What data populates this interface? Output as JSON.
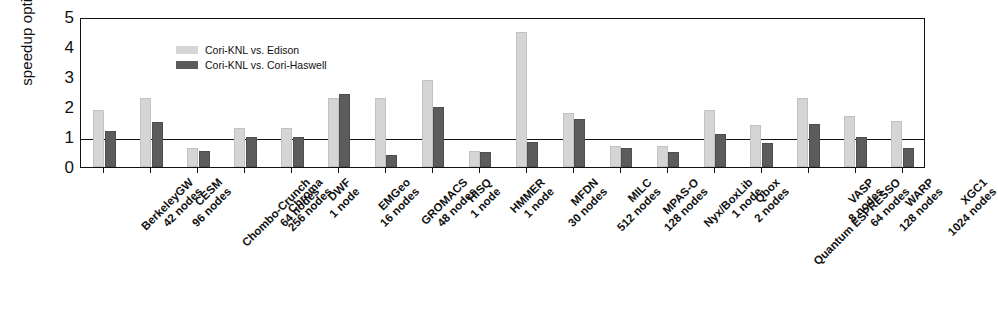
{
  "chart_data": {
    "type": "bar",
    "title": "",
    "xlabel": "",
    "ylabel": "speedup optimized",
    "ylim": [
      0,
      5
    ],
    "yticks": [
      0,
      1,
      2,
      3,
      4,
      5
    ],
    "grid": false,
    "reference_line": 1,
    "legend_position": "top-left",
    "categories": [
      "BerkeleyGW 42 nodes",
      "CESM 96 nodes",
      "Chombo-Crunch 64 nodes",
      "Chroma 256 nodes",
      "DWF 1 node",
      "EMGeo 16 nodes",
      "GROMACS 48 nodes",
      "HISQ 1 node",
      "HMMER 1 node",
      "MFDN 30 nodes",
      "MILC 512 nodes",
      "MPAS-O 128 nodes",
      "Nyx/BoxLib 1 node",
      "Qbox 2 nodes",
      "Quantum ESPRESSO 64 nodes",
      "VASP 8 nodes",
      "WARP 128 nodes",
      "XGC1 1024 nodes"
    ],
    "category_lines": [
      [
        "BerkeleyGW",
        "42 nodes"
      ],
      [
        "CESM",
        "96 nodes"
      ],
      [
        "Chombo-Crunch",
        "64 nodes"
      ],
      [
        "Chroma",
        "256 nodes"
      ],
      [
        "DWF",
        "1 node"
      ],
      [
        "EMGeo",
        "16 nodes"
      ],
      [
        "GROMACS",
        "48 nodes"
      ],
      [
        "HISQ",
        "1 node"
      ],
      [
        "HMMER",
        "1 node"
      ],
      [
        "MFDN",
        "30 nodes"
      ],
      [
        "MILC",
        "512 nodes"
      ],
      [
        "MPAS-O",
        "128 nodes"
      ],
      [
        "Nyx/BoxLib",
        "1 node"
      ],
      [
        "Qbox",
        "2 nodes"
      ],
      [
        "Quantum ESPRESSO",
        "64 nodes"
      ],
      [
        "VASP",
        "8 nodes"
      ],
      [
        "WARP",
        "128 nodes"
      ],
      [
        "XGC1",
        "1024 nodes"
      ]
    ],
    "series": [
      {
        "name": "Cori-KNL vs. Edison",
        "color": "#d5d5d5",
        "values": [
          1.9,
          2.3,
          0.65,
          1.3,
          1.3,
          2.3,
          2.3,
          2.9,
          0.55,
          4.5,
          1.8,
          0.7,
          0.7,
          1.9,
          1.4,
          2.3,
          1.7,
          1.55
        ]
      },
      {
        "name": "Cori-KNL vs. Cori-Haswell",
        "color": "#5c5c5c",
        "values": [
          1.2,
          1.5,
          0.55,
          1.0,
          1.0,
          2.45,
          0.4,
          2.0,
          0.5,
          0.85,
          1.6,
          0.65,
          0.5,
          1.1,
          0.8,
          1.45,
          1.0,
          0.62
        ]
      }
    ]
  },
  "axis": {
    "ytick_labels": [
      "0",
      "1",
      "2",
      "3",
      "4",
      "5"
    ],
    "y_title": "speedup optimized"
  },
  "legend": {
    "items": [
      {
        "label": "Cori-KNL vs. Edison",
        "swatch": "light"
      },
      {
        "label": "Cori-KNL vs. Cori-Haswell",
        "swatch": "dark"
      }
    ]
  }
}
